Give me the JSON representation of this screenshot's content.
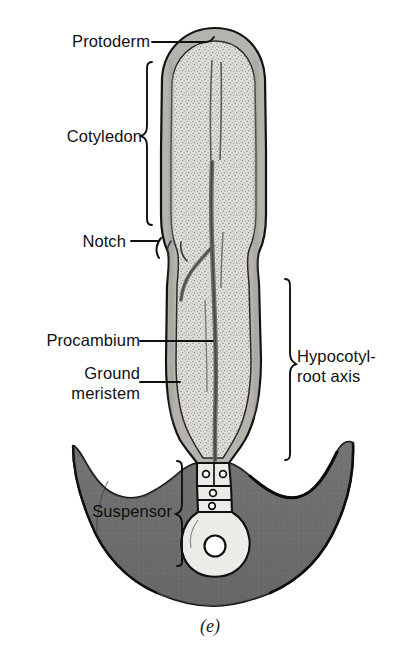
{
  "figure": {
    "caption": "(e)",
    "colors": {
      "background": "#ffffff",
      "protoderm_band": "#b3b3b3",
      "ground_meristem": "#dedbd6",
      "procambium_strand": "#8e8c88",
      "seed_coat": "#6e6e6e",
      "seed_coat_outline": "#101010",
      "suspensor_fill": "#eceae6",
      "outline": "#141414",
      "label_text": "#101010"
    }
  },
  "labels": {
    "protoderm": "Protoderm",
    "cotyledon": "Cotyledon",
    "notch": "Notch",
    "procambium": "Procambium",
    "ground_meristem_line1": "Ground",
    "ground_meristem_line2": "meristem",
    "hypocotyl_line1": "Hypocotyl-",
    "hypocotyl_line2": "root axis",
    "suspensor": "Suspensor"
  },
  "structures": [
    {
      "name": "protoderm",
      "label": "Protoderm",
      "connector": "leader-line",
      "side": "left"
    },
    {
      "name": "cotyledon",
      "label": "Cotyledon",
      "connector": "brace",
      "side": "left"
    },
    {
      "name": "notch",
      "label": "Notch",
      "connector": "leader-line",
      "side": "left"
    },
    {
      "name": "procambium",
      "label": "Procambium",
      "connector": "leader-line",
      "side": "left"
    },
    {
      "name": "ground-meristem",
      "label": "Ground meristem",
      "connector": "leader-line",
      "side": "left"
    },
    {
      "name": "hypocotyl-root-axis",
      "label": "Hypocotyl-root axis",
      "connector": "brace",
      "side": "right"
    },
    {
      "name": "suspensor",
      "label": "Suspensor",
      "connector": "brace",
      "side": "left"
    }
  ]
}
